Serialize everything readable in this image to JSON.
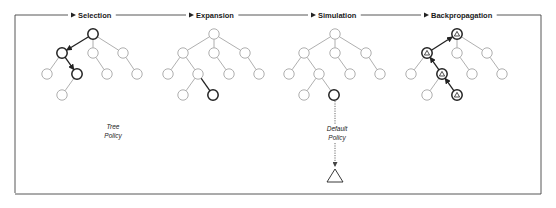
{
  "diagram": {
    "stages": [
      {
        "id": "selection",
        "label": "Selection",
        "label_x": 78,
        "arrow_x": 76
      },
      {
        "id": "expansion",
        "label": "Expansion",
        "label_x": 196,
        "arrow_x": 194
      },
      {
        "id": "simulation",
        "label": "Simulation",
        "label_x": 318,
        "arrow_x": 316
      },
      {
        "id": "backpropagation",
        "label": "Backpropagation",
        "label_x": 431,
        "arrow_x": 429
      }
    ],
    "policies": {
      "tree_policy": {
        "line1": "Tree",
        "line2": "Policy"
      },
      "default_policy": {
        "line1": "Default",
        "line2": "Policy"
      }
    },
    "colors": {
      "node_stroke": "#9a9a9a",
      "highlight_stroke": "#222222",
      "loop_stroke": "#444444"
    },
    "trees": [
      {
        "stage": "selection",
        "nodes": [
          {
            "x": 93,
            "y": 34,
            "bold": true
          },
          {
            "x": 62,
            "y": 53,
            "bold": true
          },
          {
            "x": 93,
            "y": 53
          },
          {
            "x": 123,
            "y": 53
          },
          {
            "x": 47,
            "y": 74
          },
          {
            "x": 77,
            "y": 74,
            "bold": true
          },
          {
            "x": 107,
            "y": 74
          },
          {
            "x": 137,
            "y": 74
          },
          {
            "x": 62,
            "y": 95
          }
        ],
        "edges": [
          [
            0,
            1,
            "arrow"
          ],
          [
            0,
            2
          ],
          [
            0,
            3
          ],
          [
            1,
            4
          ],
          [
            1,
            5,
            "arrow"
          ],
          [
            2,
            6
          ],
          [
            3,
            7
          ],
          [
            5,
            8
          ]
        ]
      },
      {
        "stage": "expansion",
        "nodes": [
          {
            "x": 214,
            "y": 34
          },
          {
            "x": 183,
            "y": 53
          },
          {
            "x": 214,
            "y": 53
          },
          {
            "x": 245,
            "y": 53
          },
          {
            "x": 168,
            "y": 74
          },
          {
            "x": 198,
            "y": 74
          },
          {
            "x": 229,
            "y": 74
          },
          {
            "x": 259,
            "y": 74
          },
          {
            "x": 183,
            "y": 95
          },
          {
            "x": 213,
            "y": 95,
            "bold": true
          }
        ],
        "edges": [
          [
            0,
            1
          ],
          [
            0,
            2
          ],
          [
            0,
            3
          ],
          [
            1,
            4
          ],
          [
            1,
            5
          ],
          [
            2,
            6
          ],
          [
            3,
            7
          ],
          [
            5,
            8
          ],
          [
            5,
            9,
            "bold"
          ]
        ]
      },
      {
        "stage": "simulation",
        "nodes": [
          {
            "x": 335,
            "y": 34
          },
          {
            "x": 304,
            "y": 53
          },
          {
            "x": 335,
            "y": 53
          },
          {
            "x": 366,
            "y": 53
          },
          {
            "x": 289,
            "y": 74
          },
          {
            "x": 319,
            "y": 74
          },
          {
            "x": 350,
            "y": 74
          },
          {
            "x": 380,
            "y": 74
          },
          {
            "x": 304,
            "y": 95
          },
          {
            "x": 334,
            "y": 95,
            "bold": true
          }
        ],
        "edges": [
          [
            0,
            1
          ],
          [
            0,
            2
          ],
          [
            0,
            3
          ],
          [
            1,
            4
          ],
          [
            1,
            5
          ],
          [
            2,
            6
          ],
          [
            3,
            7
          ],
          [
            5,
            8
          ],
          [
            5,
            9
          ]
        ]
      },
      {
        "stage": "backpropagation",
        "nodes": [
          {
            "x": 457,
            "y": 34,
            "bold": true,
            "delta": true
          },
          {
            "x": 427,
            "y": 53,
            "bold": true,
            "delta": true
          },
          {
            "x": 457,
            "y": 53
          },
          {
            "x": 487,
            "y": 53
          },
          {
            "x": 411,
            "y": 74
          },
          {
            "x": 442,
            "y": 74,
            "bold": true,
            "delta": true
          },
          {
            "x": 472,
            "y": 74
          },
          {
            "x": 502,
            "y": 74
          },
          {
            "x": 427,
            "y": 95
          },
          {
            "x": 457,
            "y": 95,
            "bold": true,
            "delta": true
          }
        ],
        "edges": [
          [
            1,
            0,
            "arrow"
          ],
          [
            0,
            2
          ],
          [
            0,
            3
          ],
          [
            1,
            4
          ],
          [
            5,
            1,
            "arrow"
          ],
          [
            2,
            6
          ],
          [
            3,
            7
          ],
          [
            5,
            8
          ],
          [
            9,
            5,
            "arrow"
          ]
        ]
      }
    ],
    "simulation_rollout": {
      "from_x": 335,
      "from_y": 101,
      "to_y": 167,
      "terminal": "triangle"
    }
  }
}
